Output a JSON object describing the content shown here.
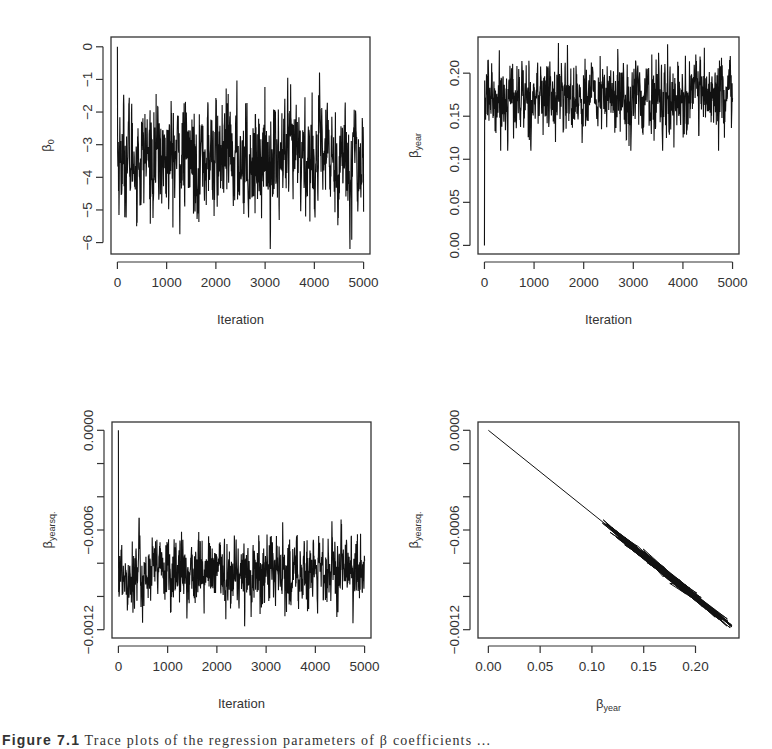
{
  "figure": {
    "caption_label": "Figure 7.1",
    "caption_text": "Trace plots of the regression parameters of β coefficients ..."
  },
  "chart_data": [
    {
      "id": "beta0-trace",
      "type": "line",
      "title": "",
      "xlabel": "Iteration",
      "ylabel": "β",
      "ylabel_sub": "0",
      "x_ticks": [
        0,
        1000,
        2000,
        3000,
        4000,
        5000
      ],
      "x_tick_labels": [
        "0",
        "1000",
        "2000",
        "3000",
        "4000",
        "5000"
      ],
      "y_ticks": [
        0,
        -1,
        -2,
        -3,
        -4,
        -5,
        -6
      ],
      "y_tick_labels": [
        "0",
        "−1",
        "−2",
        "−3",
        "−4",
        "−5",
        "−6"
      ],
      "xlim": [
        -130,
        5130
      ],
      "ylim": [
        -6.35,
        0.3
      ],
      "grid": false,
      "series": [
        {
          "name": "beta_0",
          "start": 0,
          "n_iter": 5000,
          "mean": -3.4,
          "sd": 0.85,
          "min": -6.2,
          "max": -0.4,
          "color": "#111111"
        }
      ],
      "box": {
        "left": 111,
        "top": 37,
        "right": 370,
        "bottom": 254
      }
    },
    {
      "id": "beta-year-trace",
      "type": "line",
      "title": "",
      "xlabel": "Iteration",
      "ylabel": "β",
      "ylabel_sub": "year",
      "x_ticks": [
        0,
        1000,
        2000,
        3000,
        4000,
        5000
      ],
      "x_tick_labels": [
        "0",
        "1000",
        "2000",
        "3000",
        "4000",
        "5000"
      ],
      "y_ticks": [
        0.0,
        0.05,
        0.1,
        0.15,
        0.2
      ],
      "y_tick_labels": [
        "0.00",
        "0.05",
        "0.10",
        "0.15",
        "0.20"
      ],
      "xlim": [
        -130,
        5130
      ],
      "ylim": [
        -0.01,
        0.242
      ],
      "grid": false,
      "series": [
        {
          "name": "beta_year",
          "start": 0,
          "n_iter": 5000,
          "mean": 0.172,
          "sd": 0.022,
          "min": 0.11,
          "max": 0.235,
          "color": "#111111"
        }
      ],
      "box": {
        "left": 478,
        "top": 37,
        "right": 739,
        "bottom": 254
      }
    },
    {
      "id": "beta-yearsq-trace",
      "type": "line",
      "title": "",
      "xlabel": "Iteration",
      "ylabel": "β",
      "ylabel_sub": "yearsq.",
      "x_ticks": [
        0,
        1000,
        2000,
        3000,
        4000,
        5000
      ],
      "x_tick_labels": [
        "0",
        "1000",
        "2000",
        "3000",
        "4000",
        "5000"
      ],
      "y_ticks": [
        0.0,
        -0.0002,
        -0.0004,
        -0.0006,
        -0.0008,
        -0.001,
        -0.0012
      ],
      "y_tick_labels": [
        "0.0000",
        "",
        "",
        "−0.0006",
        "",
        "",
        "−0.0012"
      ],
      "xlim": [
        -130,
        5130
      ],
      "ylim": [
        -0.00125,
        5e-05
      ],
      "grid": false,
      "series": [
        {
          "name": "beta_yearsq",
          "start": 0,
          "n_iter": 5000,
          "mean": -0.00086,
          "sd": 0.00011,
          "min": -0.00118,
          "max": -0.00053,
          "color": "#111111"
        }
      ],
      "box": {
        "left": 112,
        "top": 422,
        "right": 371,
        "bottom": 638
      }
    },
    {
      "id": "beta-year-vs-yearsq",
      "type": "scatter",
      "title": "",
      "xlabel": "β",
      "xlabel_sub": "year",
      "ylabel": "β",
      "ylabel_sub": "yearsq.",
      "x_ticks": [
        0.0,
        0.05,
        0.1,
        0.15,
        0.2
      ],
      "x_tick_labels": [
        "0.00",
        "0.05",
        "0.10",
        "0.15",
        "0.20"
      ],
      "y_ticks": [
        0.0,
        -0.0002,
        -0.0004,
        -0.0006,
        -0.0008,
        -0.001,
        -0.0012
      ],
      "y_tick_labels": [
        "0.0000",
        "",
        "",
        "−0.0006",
        "",
        "",
        "−0.0012"
      ],
      "xlim": [
        -0.01,
        0.242
      ],
      "ylim": [
        -0.00125,
        5e-05
      ],
      "grid": false,
      "series": [
        {
          "name": "joint_path",
          "start": [
            0.0,
            0.0
          ],
          "cloud_x_range": [
            0.11,
            0.235
          ],
          "cloud_y_range": [
            -0.00118,
            -0.00053
          ],
          "relation": "y ≈ -0.00503 * x",
          "color": "#111111"
        }
      ],
      "box": {
        "left": 478,
        "top": 422,
        "right": 739,
        "bottom": 638
      }
    }
  ]
}
